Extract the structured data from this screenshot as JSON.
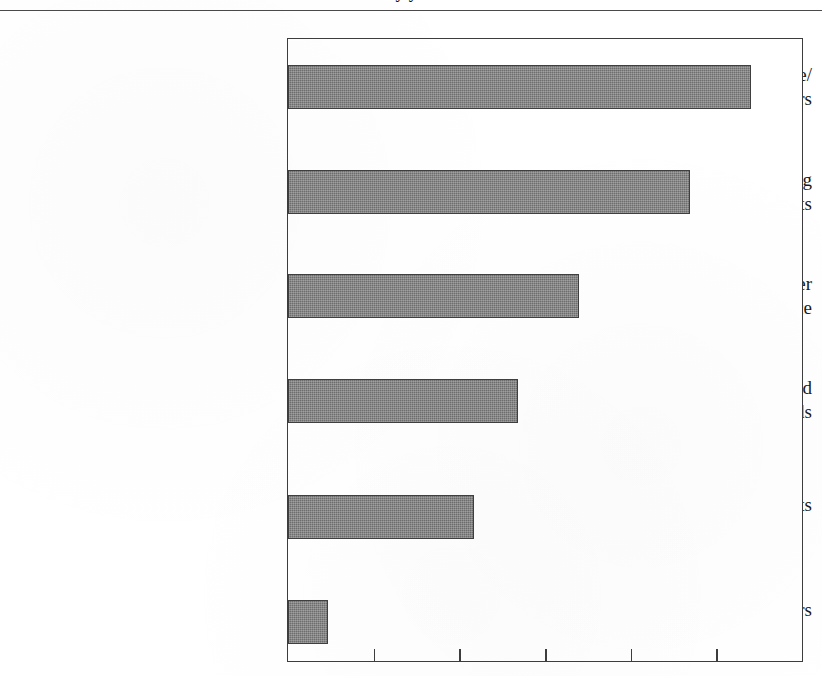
{
  "document": {
    "title_partial": "y    y    .",
    "title_note": "cut-off-at-top-edge"
  },
  "chart_data": {
    "type": "bar",
    "orientation": "horizontal",
    "title": "",
    "xlabel": "",
    "ylabel": "",
    "grid": false,
    "legend": "none",
    "categories": [
      "Lack of Acceptance/ Understanding by Investors",
      "Lack of Understanding by Consultants",
      "Do Not Deliver Stellar Performance",
      "Poor Results Obtained with Quant Methods",
      "Rising Equity Markets",
      "Black-Box Fears"
    ],
    "category_lines": [
      [
        "Lack of Acceptance/",
        "Understanding by Investors"
      ],
      [
        "Lack of Understanding",
        "by Consultants"
      ],
      [
        "Do Not Deliver",
        "Stellar Performance"
      ],
      [
        "Poor Results Obtained",
        "with Quant Methods"
      ],
      [
        "Rising Equity Markets"
      ],
      [
        "Black-Box Fears"
      ]
    ],
    "values": [
      5.4,
      4.69,
      3.4,
      2.69,
      2.17,
      0.47
    ],
    "xlim": [
      0,
      6.0
    ],
    "xticks": [
      1,
      2,
      3,
      4,
      5
    ],
    "xtick_labels": [
      "",
      "",
      "",
      "",
      ""
    ],
    "bar_color": "#6e6e6e",
    "bar_edge_color": "#3f3f3f",
    "frame_color": "#3d3d3d",
    "background": "#ffffff"
  }
}
